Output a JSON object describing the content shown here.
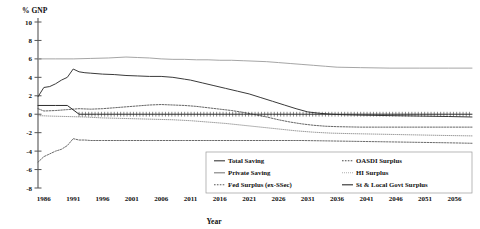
{
  "chart_data": {
    "type": "line",
    "title": "",
    "ylabel": "% GNP",
    "xlabel": "Year",
    "ylim": [
      -8,
      10
    ],
    "xlim": [
      1985,
      2059
    ],
    "ytick_labels": [
      "10",
      "8",
      "6",
      "4",
      "2",
      "0",
      "-2",
      "-4",
      "-6",
      "-8"
    ],
    "yticks": [
      10,
      8,
      6,
      4,
      2,
      0,
      -2,
      -4,
      -6,
      -8
    ],
    "xtick_labels": [
      "1986",
      "1991",
      "1996",
      "2001",
      "2006",
      "2011",
      "2016",
      "2021",
      "2026",
      "2031",
      "2036",
      "2041",
      "2046",
      "2051",
      "2056"
    ],
    "xticks": [
      1986,
      1991,
      1996,
      2001,
      2006,
      2011,
      2016,
      2021,
      2026,
      2031,
      2036,
      2041,
      2046,
      2051,
      2056
    ],
    "grid": false,
    "legend_position": "lower-right",
    "series": [
      {
        "name": "Total Saving",
        "style": "solid",
        "color": "#3a3a3a",
        "width": 1.0,
        "x": [
          1985,
          1986,
          1987,
          1988,
          1989,
          1990,
          1991,
          1992,
          1993,
          1994,
          1996,
          1998,
          2000,
          2002,
          2004,
          2006,
          2008,
          2010,
          2011,
          2013,
          2015,
          2017,
          2019,
          2021,
          2023,
          2025,
          2027,
          2029,
          2031,
          2033,
          2035,
          2037,
          2040,
          2045,
          2050,
          2055,
          2059
        ],
        "y": [
          1.9,
          2.9,
          3.0,
          3.3,
          3.7,
          4.0,
          4.9,
          4.6,
          4.5,
          4.45,
          4.35,
          4.3,
          4.2,
          4.15,
          4.1,
          4.1,
          4.0,
          3.8,
          3.7,
          3.4,
          3.1,
          2.8,
          2.5,
          2.2,
          1.8,
          1.4,
          1.0,
          0.6,
          0.25,
          0.1,
          0.0,
          -0.05,
          -0.1,
          -0.15,
          -0.2,
          -0.25,
          -0.3
        ]
      },
      {
        "name": "Private Saving",
        "style": "solid",
        "color": "#9b9b9b",
        "width": 0.9,
        "x": [
          1985,
          1988,
          1991,
          1994,
          1997,
          2000,
          2002,
          2004,
          2006,
          2008,
          2010,
          2012,
          2014,
          2016,
          2018,
          2020,
          2022,
          2024,
          2026,
          2028,
          2030,
          2032,
          2034,
          2036,
          2040,
          2045,
          2050,
          2055,
          2059
        ],
        "y": [
          6.0,
          6.0,
          6.0,
          6.05,
          6.1,
          6.2,
          6.15,
          6.1,
          6.0,
          5.95,
          5.95,
          5.9,
          5.9,
          5.85,
          5.85,
          5.8,
          5.75,
          5.7,
          5.6,
          5.5,
          5.4,
          5.3,
          5.2,
          5.1,
          5.05,
          5.0,
          5.0,
          5.0,
          5.0
        ]
      },
      {
        "name": "Fed Surplus (ex-SSec)",
        "style": "dashed",
        "color": "#5a5a5a",
        "width": 0.9,
        "x": [
          1985,
          1986,
          1987,
          1988,
          1989,
          1990,
          1991,
          1992,
          1993,
          1994,
          1996,
          2000,
          2005,
          2010,
          2015,
          2020,
          2025,
          2030,
          2035,
          2040,
          2045,
          2050,
          2055,
          2059
        ],
        "y": [
          -5.2,
          -4.6,
          -4.3,
          -4.0,
          -3.8,
          -3.4,
          -2.65,
          -2.8,
          -2.8,
          -2.85,
          -2.85,
          -2.85,
          -2.85,
          -2.85,
          -2.85,
          -2.85,
          -2.85,
          -2.85,
          -2.9,
          -2.95,
          -3.0,
          -3.05,
          -3.1,
          -3.15
        ]
      },
      {
        "name": "OASDI Surplus",
        "style": "dashed",
        "color": "#4a4a4a",
        "width": 0.85,
        "x": [
          1985,
          1986,
          1988,
          1990,
          1992,
          1994,
          1996,
          1998,
          2000,
          2002,
          2004,
          2006,
          2008,
          2010,
          2012,
          2014,
          2016,
          2018,
          2020,
          2022,
          2024,
          2026,
          2028,
          2030,
          2032,
          2034,
          2036,
          2040,
          2045,
          2050,
          2055,
          2059
        ],
        "y": [
          0.6,
          0.35,
          0.4,
          0.5,
          0.6,
          0.55,
          0.6,
          0.7,
          0.8,
          0.9,
          1.0,
          1.05,
          1.0,
          0.95,
          0.85,
          0.7,
          0.55,
          0.4,
          0.2,
          -0.05,
          -0.3,
          -0.6,
          -0.85,
          -1.05,
          -1.2,
          -1.3,
          -1.35,
          -1.4,
          -1.4,
          -1.4,
          -1.4,
          -1.4
        ]
      },
      {
        "name": "HI Surplus",
        "style": "dotted",
        "color": "#8a8a8a",
        "width": 0.85,
        "x": [
          1985,
          1987,
          1990,
          1993,
          1996,
          1999,
          2002,
          2005,
          2008,
          2011,
          2014,
          2017,
          2020,
          2023,
          2026,
          2029,
          2032,
          2035,
          2038,
          2042,
          2046,
          2050,
          2054,
          2059
        ],
        "y": [
          -0.15,
          -0.2,
          -0.25,
          -0.3,
          -0.4,
          -0.45,
          -0.5,
          -0.55,
          -0.6,
          -0.7,
          -0.85,
          -1.0,
          -1.2,
          -1.4,
          -1.6,
          -1.8,
          -1.95,
          -2.05,
          -2.1,
          -2.15,
          -2.2,
          -2.25,
          -2.3,
          -2.35
        ]
      },
      {
        "name": "St & Local Govt Surplus",
        "style": "solid-ticked",
        "color": "#2b2b2b",
        "width": 1.0,
        "x": [
          1985,
          1988,
          1990,
          1992,
          1995,
          1998,
          2000,
          2005,
          2010,
          2015,
          2020,
          2025,
          2030,
          2035,
          2040,
          2045,
          2050,
          2055,
          2059
        ],
        "y": [
          0.95,
          0.95,
          0.95,
          0.0,
          0.0,
          0.0,
          0.0,
          0.0,
          0.0,
          0.0,
          0.0,
          0.0,
          0.0,
          0.0,
          0.0,
          0.0,
          0.0,
          0.0,
          0.0
        ]
      }
    ],
    "legend_entries": [
      {
        "label": "Total Saving",
        "style": "solid",
        "color": "#3a3a3a"
      },
      {
        "label": "Private Saving",
        "style": "solid",
        "color": "#7d7d7d"
      },
      {
        "label": "Fed Surplus (ex-SSec)",
        "style": "dashed",
        "color": "#5a5a5a"
      },
      {
        "label": "OASDI Surplus",
        "style": "dashed",
        "color": "#4a4a4a"
      },
      {
        "label": "HI Surplus",
        "style": "dotted",
        "color": "#8a8a8a"
      },
      {
        "label": "St & Local Govt Surplus",
        "style": "solid",
        "color": "#2b2b2b"
      }
    ]
  }
}
